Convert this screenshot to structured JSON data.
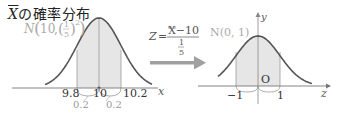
{
  "title": {
    "var": "X",
    "suffix": "の確率分布"
  },
  "left_dist": {
    "label_N": "N",
    "mean": "10",
    "sigma_num": "1",
    "sigma_den": "5",
    "power": "2"
  },
  "left_axis": {
    "x_label": "x",
    "ticks": [
      "9.8",
      "10",
      "10.2"
    ],
    "widths": [
      "0.2",
      "0.2"
    ]
  },
  "transform": {
    "z": "Z",
    "eq": "=",
    "numerator": "X−10",
    "den_num": "1",
    "den_den": "5"
  },
  "right_dist": {
    "label": "N(0, 1)"
  },
  "right_axis": {
    "x_label": "z",
    "y_label": "y",
    "origin": "O",
    "ticks": [
      "−1",
      "1"
    ]
  },
  "colors": {
    "curve": "#555555",
    "shade": "#e6e6e6",
    "arrow": "#a0a0a0",
    "faint": "#999999"
  }
}
